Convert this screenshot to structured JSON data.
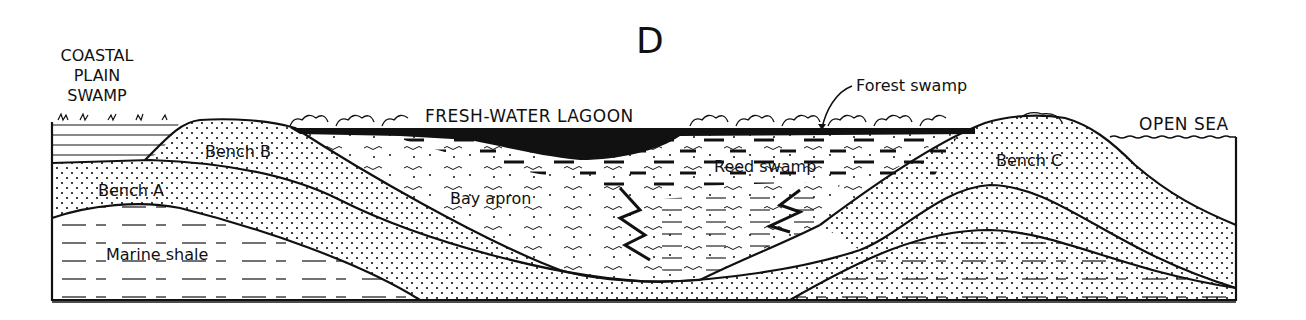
{
  "figure": {
    "panel_label": "D",
    "labels": {
      "coastal_plain_swamp": [
        "COASTAL",
        "PLAIN",
        "SWAMP"
      ],
      "fresh_water_lagoon": "FRESH-WATER LAGOON",
      "forest_swamp": "Forest swamp",
      "open_sea": "OPEN SEA",
      "bench_a": "Bench A",
      "bench_b": "Bench B",
      "bench_c": "Bench C",
      "bay_apron": "Bay apron",
      "reed_swamp": "Reed swamp",
      "marine_shale": "Marine shale"
    },
    "colors": {
      "ink": "#111111",
      "background": "#ffffff"
    }
  }
}
